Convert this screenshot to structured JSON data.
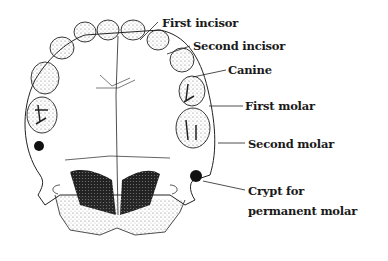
{
  "figure": {
    "labels": [
      {
        "id": "first_incisor",
        "text": "First incisor"
      },
      {
        "id": "second_incisor",
        "text": "Second incisor"
      },
      {
        "id": "canine",
        "text": "Canine"
      },
      {
        "id": "first_molar",
        "text": "First molar"
      },
      {
        "id": "second_molar",
        "text": "Second molar"
      },
      {
        "id": "crypt_line1",
        "text": "Crypt for"
      },
      {
        "id": "crypt_line2",
        "text": "permanent molar"
      }
    ]
  }
}
